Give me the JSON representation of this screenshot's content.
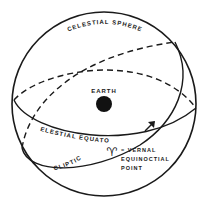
{
  "diagram": {
    "labels": {
      "sphere": "CELESTIAL SPHERE",
      "earth": "EARTH",
      "equator": "CELESTIAL EQUATOR",
      "ecliptic": "ECLIPTIC",
      "vernal_symbol": "♈",
      "vernal_line1": "= VERNAL",
      "vernal_line2": "EQUINOCTIAL",
      "vernal_line3": "POINT"
    },
    "icons": {
      "earth": "filled-circle",
      "direction_arrow": "arrow-up-right",
      "vernal_point": "aries-symbol"
    },
    "colors": {
      "ink": "#1a1a1a",
      "background": "#ffffff"
    }
  }
}
